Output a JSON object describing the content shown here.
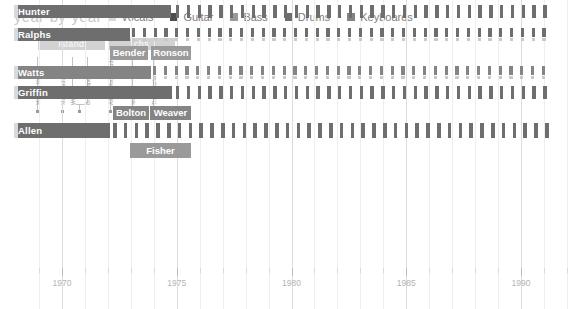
{
  "header": {
    "title": "year-by-year"
  },
  "legend": {
    "items": [
      {
        "label": "Vocals",
        "color": "#d9d9d9"
      },
      {
        "label": "Guitar",
        "color": "#4d4d4d"
      },
      {
        "label": "Bass",
        "color": "#9a9a9a"
      },
      {
        "label": "Drums",
        "color": "#6e6e6e"
      },
      {
        "label": "Keyboards",
        "color": "#848484"
      }
    ]
  },
  "labels_eras": [
    {
      "name": "island",
      "x": 38,
      "w": 67,
      "start": 1969.3,
      "end": 1972.4
    },
    {
      "name": "cbs",
      "x": 108,
      "w": 67,
      "start": 1972.5,
      "end": 1975.6
    }
  ],
  "albums": [
    {
      "title": "Mott the Hoople",
      "x": 37,
      "year": 1969.3
    },
    {
      "title": "Mad Shadows",
      "x": 62,
      "year": 1970.4
    },
    {
      "title": "Wildlife",
      "x": 72,
      "year": 1971.0
    },
    {
      "title": "Brain Capers",
      "x": 87,
      "year": 1971.6
    },
    {
      "title": "All The Young Dudes",
      "x": 110,
      "year": 1972.6
    },
    {
      "title": "Mott",
      "x": 132,
      "year": 1973.6
    },
    {
      "title": "The Hoople",
      "x": 153,
      "year": 1974.5
    }
  ],
  "chart_data": {
    "type": "bar",
    "title": "year-by-year",
    "xlabel": "",
    "ylabel": "",
    "xlim": [
      1968.5,
      1992.0
    ],
    "grid": true,
    "legend_position": "top",
    "xticks": [
      1970,
      1975,
      1980,
      1985,
      1990
    ],
    "xtick_labels": [
      "1970",
      "1975",
      "1980",
      "1985",
      "1990"
    ],
    "categories": [
      "Hunter",
      "Ralphs",
      "Bender",
      "Ronson",
      "Watts",
      "Griffin",
      "Bolton",
      "Weaver",
      "Allen",
      "Fisher"
    ],
    "series": [
      {
        "name": "Vocals",
        "color": "#d9d9d9"
      },
      {
        "name": "Guitar",
        "color": "#4d4d4d"
      },
      {
        "name": "Bass",
        "color": "#9a9a9a"
      },
      {
        "name": "Drums",
        "color": "#6e6e6e"
      },
      {
        "name": "Keyboards",
        "color": "#848484"
      }
    ],
    "rows": [
      {
        "name": "Hunter",
        "label_x": 18,
        "y": 117,
        "h": 13,
        "solid": [
          {
            "x": 14,
            "w": 4,
            "color": "#d9d9d9",
            "part": "vocals"
          },
          {
            "x": 18,
            "w": 153,
            "color": "#6e6e6e",
            "part": "guitar"
          }
        ],
        "dashed": [
          {
            "x": 176,
            "w": 387,
            "color": "#6e6e6e",
            "period": 10.8,
            "duty": 0.32,
            "y": 0,
            "h": 13
          }
        ]
      },
      {
        "name": "Ralphs",
        "label_x": 18,
        "y": 140,
        "h": 13,
        "solid": [
          {
            "x": 14,
            "w": 4,
            "color": "#d9d9d9",
            "part": "vocals"
          },
          {
            "x": 18,
            "w": 112,
            "color": "#6e6e6e",
            "part": "guitar"
          }
        ],
        "dashed": [
          {
            "x": 132,
            "w": 431,
            "color": "#6e6e6e",
            "period": 10.8,
            "duty": 0.3,
            "y": 0,
            "h": 9
          },
          {
            "x": 132,
            "w": 431,
            "color": "#c9c9c9",
            "period": 10.8,
            "duty": 0.3,
            "y": 10,
            "h": 3
          }
        ]
      },
      {
        "name": "Bender",
        "label_x": 113,
        "y": 158,
        "h": 14,
        "solid": [
          {
            "x": 110,
            "w": 38,
            "color": "#9a9a9a",
            "part": "guitar"
          }
        ],
        "dashed": []
      },
      {
        "name": "Ronson",
        "label_x": 154,
        "y": 158,
        "h": 14,
        "solid": [
          {
            "x": 151,
            "w": 40,
            "color": "#9a9a9a",
            "part": "guitar"
          }
        ],
        "dashed": []
      },
      {
        "name": "Watts",
        "label_x": 18,
        "y": 178,
        "h": 13,
        "solid": [
          {
            "x": 14,
            "w": 4,
            "color": "#d9d9d9",
            "part": "vocals"
          },
          {
            "x": 18,
            "w": 133,
            "color": "#848484",
            "part": "bass"
          }
        ],
        "dashed": [
          {
            "x": 153,
            "w": 410,
            "color": "#848484",
            "period": 10.8,
            "duty": 0.3,
            "y": 0,
            "h": 9
          },
          {
            "x": 153,
            "w": 410,
            "color": "#c9c9c9",
            "period": 10.8,
            "duty": 0.3,
            "y": 10,
            "h": 3
          }
        ]
      },
      {
        "name": "Griffin",
        "label_x": 18,
        "y": 198,
        "h": 13,
        "solid": [
          {
            "x": 14,
            "w": 4,
            "color": "#d9d9d9",
            "part": "vocals"
          },
          {
            "x": 18,
            "w": 154,
            "color": "#6e6e6e",
            "part": "drums"
          }
        ],
        "dashed": [
          {
            "x": 176,
            "w": 387,
            "color": "#6e6e6e",
            "period": 10.8,
            "duty": 0.32,
            "y": 0,
            "h": 13
          }
        ]
      },
      {
        "name": "Bolton",
        "label_x": 116,
        "y": 218,
        "h": 14,
        "solid": [
          {
            "x": 113,
            "w": 36,
            "color": "#848484",
            "part": "keyboards"
          }
        ],
        "dashed": []
      },
      {
        "name": "Weaver",
        "label_x": 153,
        "y": 218,
        "h": 14,
        "solid": [
          {
            "x": 150,
            "w": 41,
            "color": "#848484",
            "part": "keyboards"
          }
        ],
        "dashed": []
      },
      {
        "name": "Allen",
        "label_x": 18,
        "y": 235,
        "h": 15,
        "solid": [
          {
            "x": 14,
            "w": 4,
            "color": "#d9d9d9",
            "part": "vocals"
          },
          {
            "x": 18,
            "w": 92,
            "color": "#6e6e6e",
            "part": "keyboards"
          }
        ],
        "dashed": [
          {
            "x": 113,
            "w": 450,
            "color": "#6e6e6e",
            "period": 10.8,
            "duty": 0.34,
            "y": 0,
            "h": 15
          }
        ]
      },
      {
        "name": "Fisher",
        "label_x": 133,
        "y": 255,
        "h": 15,
        "solid": [
          {
            "x": 130,
            "w": 61,
            "color": "#9a9a9a",
            "part": "keyboards"
          }
        ],
        "dashed": []
      }
    ]
  }
}
